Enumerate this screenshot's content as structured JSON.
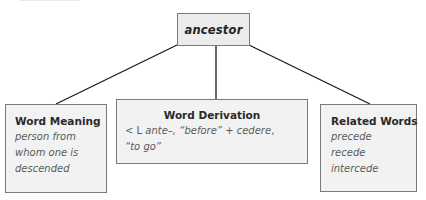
{
  "diagram": {
    "root": {
      "label": "ancestor"
    },
    "children": [
      {
        "heading": "Word Meaning",
        "lines": [
          "person from",
          "whom one is",
          "descended"
        ]
      },
      {
        "heading": "Word Derivation",
        "line1": {
          "prefix": "< L ",
          "latin1": "ante–",
          "gloss1": ", “before” + ",
          "latin2": "cedere",
          "trail": ","
        },
        "line2": {
          "gloss2": "“to go”"
        }
      },
      {
        "heading": "Related Words",
        "lines": [
          "precede",
          "recede",
          "intercede"
        ]
      }
    ],
    "colors": {
      "box_fill": "#f2f2f2",
      "box_border": "#7a7a7a",
      "connector": "#1a1a1a"
    }
  }
}
